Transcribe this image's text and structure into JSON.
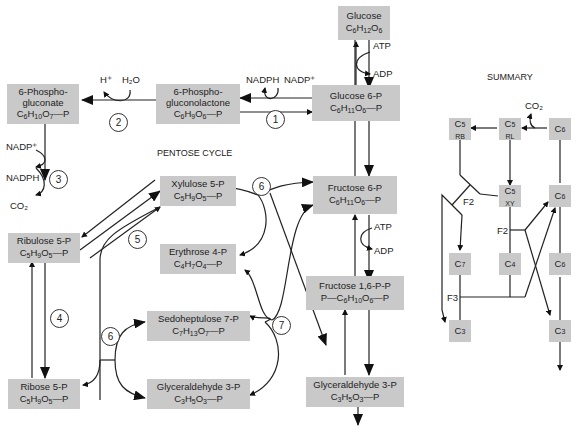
{
  "title": "PENTOSE CYCLE",
  "summary_title": "SUMMARY",
  "boxes": {
    "glucose": {
      "name": "Glucose",
      "formula": "C6H12O6"
    },
    "g6p": {
      "name": "Glucose 6-P",
      "formula": "C6H11O6—P"
    },
    "pgl": {
      "name": "6-Phospho-\ngluconolactone",
      "formula": "C6H9O6—P"
    },
    "pgn": {
      "name": "6-Phospho-\ngluconate",
      "formula": "C6H10O7—P"
    },
    "ru5p": {
      "name": "Ribulose 5-P",
      "formula": "C5H9O5—P"
    },
    "r5p": {
      "name": "Ribose 5-P",
      "formula": "C5H9O5—P"
    },
    "xu5p": {
      "name": "Xylulose 5-P",
      "formula": "C5H9O5—P"
    },
    "e4p": {
      "name": "Erythrose 4-P",
      "formula": "C4H7O4—P"
    },
    "s7p": {
      "name": "Sedoheptulose 7-P",
      "formula": "C7H13O7—P"
    },
    "ga3p_left": {
      "name": "Glyceraldehyde 3-P",
      "formula": "C3H5O3—P"
    },
    "f6p": {
      "name": "Fructose 6-P",
      "formula": "C6H11O6—P"
    },
    "f16bp": {
      "name": "Fructose 1,6-P-P",
      "formula": "P—C6H10O6—P"
    },
    "ga3p_right": {
      "name": "Glyceraldehyde 3-P",
      "formula": "C3H5O3—P"
    }
  },
  "cofactors": {
    "atp1": "ATP",
    "adp1": "ADP",
    "nadph1": "NADPH",
    "nadp1": "NADP⁺",
    "hplus": "H⁺",
    "h2o": "H₂O",
    "nadp3": "NADP⁺",
    "nadph3": "NADPH",
    "co2": "CO₂",
    "atp2": "ATP",
    "adp2": "ADP"
  },
  "steps": [
    "1",
    "2",
    "3",
    "4",
    "5",
    "6",
    "6",
    "7"
  ],
  "summary": {
    "co2": "CO₂",
    "boxes": [
      {
        "id": "c5rb",
        "main": "C",
        "sub": "5",
        "tag": "RB"
      },
      {
        "id": "c5rl",
        "main": "C",
        "sub": "5",
        "tag": "RL"
      },
      {
        "id": "c6a",
        "main": "C",
        "sub": "6",
        "tag": ""
      },
      {
        "id": "c5xy",
        "main": "C",
        "sub": "5",
        "tag": "XY"
      },
      {
        "id": "c6b",
        "main": "C",
        "sub": "6",
        "tag": ""
      },
      {
        "id": "c7",
        "main": "C",
        "sub": "7",
        "tag": ""
      },
      {
        "id": "c4",
        "main": "C",
        "sub": "4",
        "tag": ""
      },
      {
        "id": "c6c",
        "main": "C",
        "sub": "6",
        "tag": ""
      },
      {
        "id": "c3a",
        "main": "C",
        "sub": "3",
        "tag": ""
      },
      {
        "id": "c3b",
        "main": "C",
        "sub": "3",
        "tag": ""
      }
    ],
    "labels": {
      "f2a": "F2",
      "f2b": "F2",
      "f3": "F3"
    }
  }
}
